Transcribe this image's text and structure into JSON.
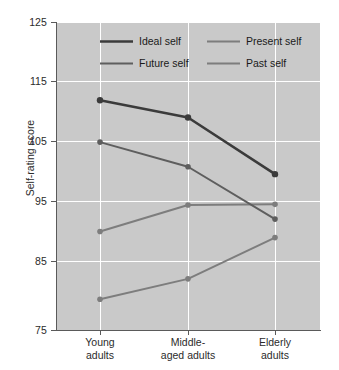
{
  "chart_data": {
    "type": "line",
    "title": "",
    "xlabel": "",
    "ylabel": "Self-rating score",
    "categories": [
      "Young\nadults",
      "Middle-\naged adults",
      "Elderly\nadults"
    ],
    "category_labels": [
      {
        "line1": "Young",
        "line2": "adults"
      },
      {
        "line1": "Middle-",
        "line2": "aged adults"
      },
      {
        "line1": "Elderly",
        "line2": "adults"
      }
    ],
    "ylim": [
      75,
      125
    ],
    "yticks": [
      125,
      115,
      105,
      95,
      85,
      75
    ],
    "ytick_labels": [
      "125",
      "115",
      "105",
      "95",
      "85",
      "75"
    ],
    "grid": true,
    "legend_position": "top-center-inside",
    "series": [
      {
        "name": "Ideal self",
        "values": [
          112.3,
          109.5,
          100.3
        ],
        "color": "#3b3b3b",
        "width": 2.6
      },
      {
        "name": "Present self",
        "values": [
          91.0,
          95.3,
          95.4
        ],
        "color": "#7d7d7d",
        "width": 2.0
      },
      {
        "name": "Future self",
        "values": [
          105.5,
          101.5,
          93.0
        ],
        "color": "#5e5e5e",
        "width": 2.0
      },
      {
        "name": "Past self",
        "values": [
          80.0,
          83.3,
          90.0
        ],
        "color": "#7d7d7d",
        "width": 2.0
      }
    ],
    "legend_entries": [
      "Ideal self",
      "Present self",
      "Future self",
      "Past self"
    ],
    "colors": {
      "plot_background": "#c9c9c9",
      "gridline": "#ffffff",
      "axis": "#5a5a5a",
      "text": "#2b2b2b",
      "ideal_self": "#3b3b3b",
      "future_self": "#5e5e5e",
      "present_self": "#7d7d7d",
      "past_self": "#7d7d7d"
    }
  }
}
